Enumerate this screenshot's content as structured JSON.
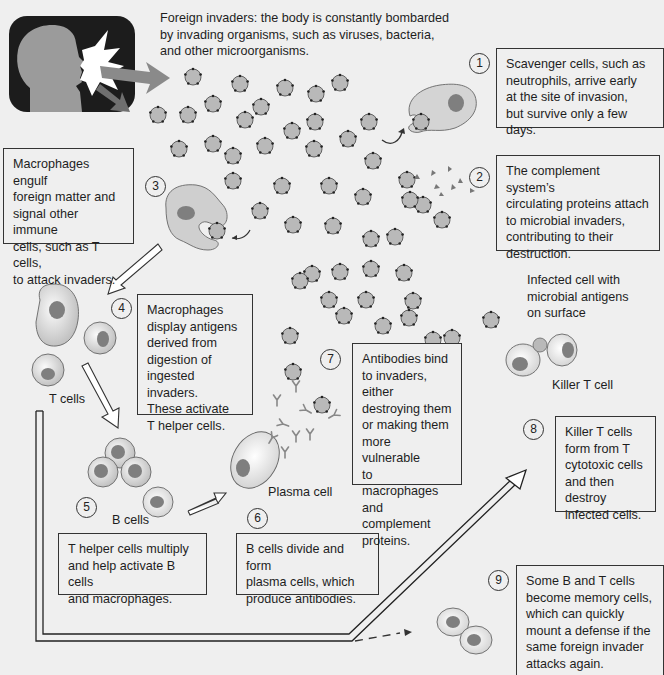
{
  "intro": {
    "text_lines": [
      "Foreign invaders: the body is constantly bombarded",
      "by invading organisms, such as viruses, bacteria,",
      "and other microorganisms."
    ]
  },
  "steps": [
    {
      "number": "1",
      "lines": [
        "Scavenger cells, such as",
        "neutrophils, arrive early",
        "at the site of invasion,",
        "but survive only a few days."
      ]
    },
    {
      "number": "2",
      "lines": [
        "The complement system’s",
        "circulating proteins attach",
        "to microbial invaders,",
        "contributing to their",
        "destruction."
      ]
    },
    {
      "number": "3",
      "lines": [
        "Macrophages engulf",
        "foreign matter and",
        "signal other immune",
        "cells, such as T cells,",
        "to attack invaders."
      ]
    },
    {
      "number": "4",
      "lines": [
        "Macrophages",
        "display antigens",
        "derived from",
        "digestion of",
        "ingested invaders.",
        "These activate",
        "T helper cells."
      ]
    },
    {
      "number": "5",
      "lines": [
        "T helper cells multiply",
        "and help activate B cells",
        "and macrophages."
      ]
    },
    {
      "number": "6",
      "lines": [
        "B cells divide and form",
        "plasma cells, which",
        "produce antibodies."
      ]
    },
    {
      "number": "7",
      "lines": [
        "Antibodies bind",
        "to invaders, either",
        "destroying them",
        "or making them",
        "more vulnerable",
        "to macrophages",
        "and complement",
        "proteins."
      ]
    },
    {
      "number": "8",
      "lines": [
        "Killer T cells",
        "form from T",
        "cytotoxic cells",
        "and then destroy",
        "infected cells."
      ]
    },
    {
      "number": "9",
      "lines": [
        "Some B and T cells",
        "become memory cells,",
        "which can quickly",
        "mount a defense if the",
        "same foreign invader",
        "attacks again."
      ]
    }
  ],
  "labels": {
    "t_cells": "T cells",
    "b_cells": "B cells",
    "plasma_cell": "Plasma cell",
    "killer_t_cell": "Killer T cell",
    "infected_cell": [
      "Infected cell with",
      "microbial antigens",
      "on surface"
    ]
  },
  "icons": {
    "person": "person-coughing-icon",
    "invader": "microbe-icon",
    "scavenger": "neutrophil-icon",
    "macrophage": "macrophage-icon",
    "antibody": "antibody-icon"
  },
  "colors": {
    "background": "#efefef",
    "invader_fill": "#b9b9b9",
    "cell_fill": "#d6d6d6",
    "nucleus": "#7f7f7f",
    "icon_bg": "#1c1c1c",
    "arrow_gray": "#8a8a8a"
  }
}
